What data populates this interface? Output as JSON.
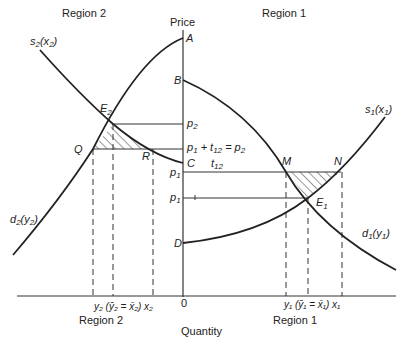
{
  "titles": {
    "region_left_top": "Region 2",
    "region_right_top": "Region 1",
    "region_left_bottom": "Region 2",
    "region_right_bottom": "Region 1",
    "y_axis": "Price",
    "x_axis": "Quantity",
    "origin": "0"
  },
  "points": {
    "A": "A",
    "B": "B",
    "C": "C",
    "D": "D",
    "E2": "E",
    "E2_sub": "2",
    "E1": "E",
    "E1_sub": "1",
    "Q": "Q",
    "R": "R",
    "M": "M",
    "N": "N"
  },
  "curves": {
    "s2": "s",
    "s2_sub": "2",
    "s2_arg": "(x",
    "s2_arg_sub": "2",
    "s2_close": ")",
    "d2": "d",
    "d2_sub": "2",
    "d2_arg": "(y",
    "d2_arg_sub": "2",
    "d2_close": ")",
    "s1": "s",
    "s1_sub": "1",
    "s1_arg": "(x",
    "s1_arg_sub": "1",
    "s1_close": ")",
    "d1": "d",
    "d1_sub": "1",
    "d1_arg": "(y",
    "d1_arg_sub": "1",
    "d1_close": ")"
  },
  "price_labels": {
    "p2": "p",
    "p2_sub": "2",
    "p1_plus_t12": "p",
    "p1_plus_t12_sub1": "1",
    "p1_plus_t12_mid": " + t",
    "p1_plus_t12_sub2": "12",
    "p1_plus_t12_eq": " = p",
    "p1_plus_t12_sub3": "2",
    "t12": "t",
    "t12_sub": "12",
    "p1_upper": "p",
    "p1_upper_sub": "1",
    "p1_lower": "p",
    "p1_lower_sub": "1"
  },
  "quantity_labels": {
    "region2": "y₂ (ȳ₂ = x̄₂) x₂",
    "region1": "y₁ (ȳ₁ = x̄₁) x₁"
  }
}
